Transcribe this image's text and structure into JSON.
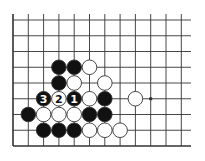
{
  "diagram": {
    "type": "go-board-fragment",
    "colors": {
      "background": "#ffffff",
      "line": "#333333",
      "black_stone": "#111111",
      "white_stone": "#ffffff",
      "stone_outline": "#333333"
    },
    "grid": {
      "cols": 12,
      "rows": 9,
      "x0": 13,
      "y0": 20,
      "dx": 15.3,
      "dy": 15.75,
      "line_extend_right": 191,
      "edges": {
        "left": true,
        "bottom": true,
        "top": false,
        "right": false
      }
    },
    "star_points": [
      {
        "col": 9,
        "row": 5
      }
    ],
    "stones": [
      {
        "col": 3,
        "row": 3,
        "color": "black"
      },
      {
        "col": 4,
        "row": 3,
        "color": "black"
      },
      {
        "col": 5,
        "row": 3,
        "color": "white"
      },
      {
        "col": 3,
        "row": 4,
        "color": "black"
      },
      {
        "col": 4,
        "row": 4,
        "color": "white"
      },
      {
        "col": 6,
        "row": 4,
        "color": "white"
      },
      {
        "col": 2,
        "row": 5,
        "color": "black",
        "label": "3"
      },
      {
        "col": 3,
        "row": 5,
        "color": "white",
        "label": "2"
      },
      {
        "col": 4,
        "row": 5,
        "color": "black",
        "label": "1"
      },
      {
        "col": 5,
        "row": 5,
        "color": "white"
      },
      {
        "col": 6,
        "row": 5,
        "color": "black"
      },
      {
        "col": 8,
        "row": 5,
        "color": "white"
      },
      {
        "col": 1,
        "row": 6,
        "color": "black"
      },
      {
        "col": 2,
        "row": 6,
        "color": "white"
      },
      {
        "col": 3,
        "row": 6,
        "color": "white"
      },
      {
        "col": 4,
        "row": 6,
        "color": "white"
      },
      {
        "col": 5,
        "row": 6,
        "color": "black"
      },
      {
        "col": 6,
        "row": 6,
        "color": "black"
      },
      {
        "col": 2,
        "row": 7,
        "color": "black"
      },
      {
        "col": 3,
        "row": 7,
        "color": "black"
      },
      {
        "col": 4,
        "row": 7,
        "color": "black"
      },
      {
        "col": 5,
        "row": 7,
        "color": "white"
      },
      {
        "col": 6,
        "row": 7,
        "color": "white"
      },
      {
        "col": 7,
        "row": 7,
        "color": "white"
      }
    ],
    "move_labels": [
      "1",
      "2",
      "3"
    ]
  }
}
